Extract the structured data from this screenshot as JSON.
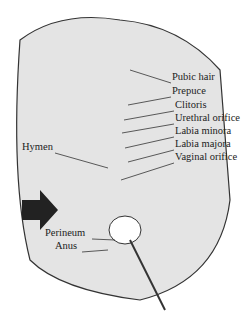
{
  "diagram": {
    "type": "labeled anatomical illustration (schematic)",
    "labels_right": [
      {
        "text": "Pubic hair",
        "x": 172,
        "y": 77
      },
      {
        "text": "Prepuce",
        "x": 172,
        "y": 91
      },
      {
        "text": "Clitoris",
        "x": 175,
        "y": 105
      },
      {
        "text": "Urethral orifice",
        "x": 175,
        "y": 118
      },
      {
        "text": "Labia minora",
        "x": 175,
        "y": 131
      },
      {
        "text": "Labia majora",
        "x": 175,
        "y": 144
      },
      {
        "text": "Vaginal orifice",
        "x": 175,
        "y": 157
      }
    ],
    "labels_left": [
      {
        "text": "Hymen",
        "x": 22,
        "y": 147
      },
      {
        "text": "Perineum",
        "x": 45,
        "y": 233
      },
      {
        "text": "Anus",
        "x": 55,
        "y": 246
      }
    ]
  }
}
